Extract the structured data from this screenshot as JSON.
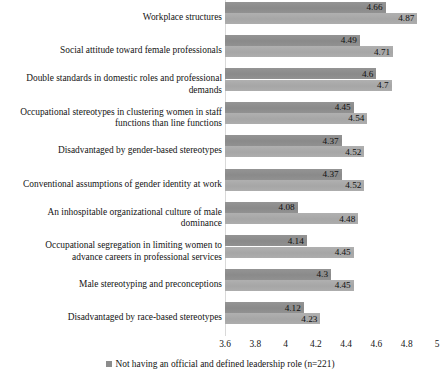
{
  "chart_data": {
    "type": "bar",
    "orientation": "horizontal",
    "title": "",
    "xlabel": "",
    "ylabel": "",
    "xlim": [
      3.6,
      5
    ],
    "xticks": [
      "3.6",
      "3.8",
      "4",
      "4.2",
      "4.4",
      "4.6",
      "4.8",
      "5"
    ],
    "xtick_values": [
      3.6,
      3.8,
      4,
      4.2,
      4.4,
      4.6,
      4.8,
      5
    ],
    "grid": false,
    "legend_position": "bottom",
    "categories": [
      "Workplace structures",
      "Social attitude toward female professionals",
      "Double standards in domestic roles and professional\ndemands",
      "Occupational stereotypes in clustering women in staff\nfunctions than line functions",
      "Disadvantaged by gender-based stereotypes",
      "Conventional assumptions of gender identity at work",
      "An inhospitable organizational culture of male\ndominance",
      "Occupational segregation in limiting women to\nadvance careers in professional services",
      "Male stereotyping and preconceptions",
      "Disadvantaged by race-based stereotypes"
    ],
    "series": [
      {
        "name": "series-dark",
        "color": "#8c8c8c",
        "values": [
          4.66,
          4.49,
          4.6,
          4.45,
          4.37,
          4.37,
          4.08,
          4.14,
          4.3,
          4.12
        ],
        "labels": [
          "4.66",
          "4.49",
          "4.6",
          "4.45",
          "4.37",
          "4.37",
          "4.08",
          "4.14",
          "4.3",
          "4.12"
        ]
      },
      {
        "name": "series-light",
        "color": "#a9a9a9",
        "values": [
          4.87,
          4.71,
          4.7,
          4.54,
          4.52,
          4.52,
          4.48,
          4.45,
          4.45,
          4.23
        ],
        "labels": [
          "4.87",
          "4.71",
          "4.7",
          "4.54",
          "4.52",
          "4.52",
          "4.48",
          "4.45",
          "4.45",
          "4.23"
        ]
      }
    ],
    "legend": [
      {
        "label": "Not having an official and defined leadership role (n=221)",
        "color": "#8c8c8c",
        "marker": "square-marker"
      }
    ]
  }
}
